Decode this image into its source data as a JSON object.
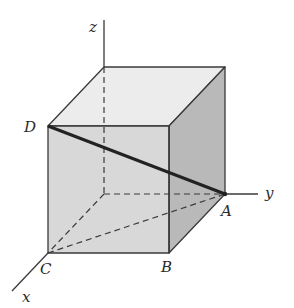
{
  "diagram": {
    "type": "cube-in-3d-axes",
    "axes": {
      "x": {
        "label": "x"
      },
      "y": {
        "label": "y"
      },
      "z": {
        "label": "z"
      }
    },
    "points": {
      "A": {
        "label": "A"
      },
      "B": {
        "label": "B"
      },
      "C": {
        "label": "C"
      },
      "D": {
        "label": "D"
      }
    },
    "highlighted_segment": "DA",
    "dashed_segments": [
      "origin-C",
      "origin-A",
      "origin-top",
      "C-A"
    ],
    "colors": {
      "top_face": "#ececec",
      "front_face": "#d6d6d6",
      "right_face": "#b9b9b9",
      "edge": "#3a3a3a",
      "diagonal": "#222222"
    }
  }
}
